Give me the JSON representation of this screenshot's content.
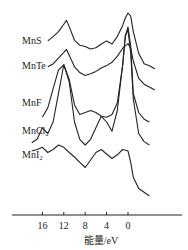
{
  "chart_data": {
    "type": "line",
    "title": "",
    "xlabel": "能量/eV",
    "ylabel": "",
    "x_reversed": true,
    "xlim": [
      20,
      -5
    ],
    "xticks": [
      16,
      12,
      8,
      4,
      0
    ],
    "xtick_labels": [
      "16",
      "12",
      "8",
      "4",
      "0"
    ],
    "grid": false,
    "legend": "none",
    "y_units": "arbitrary (intensity, vertically offset spectra)",
    "series": [
      {
        "name": "MnS",
        "label": "MnS",
        "x": [
          15,
          14,
          13,
          12,
          11.5,
          11,
          10,
          9,
          8,
          7,
          6,
          5,
          4,
          3,
          2,
          1,
          0.5,
          0,
          -0.5,
          -1,
          -2,
          -3,
          -4,
          -5
        ],
        "y": [
          0.55,
          0.62,
          0.7,
          0.82,
          0.88,
          0.78,
          0.56,
          0.48,
          0.46,
          0.42,
          0.44,
          0.5,
          0.55,
          0.5,
          0.62,
          0.8,
          0.92,
          1.0,
          0.95,
          0.7,
          0.35,
          0.18,
          0.15,
          0.1
        ]
      },
      {
        "name": "MnTe",
        "label": "MnTe",
        "x": [
          15,
          14,
          13,
          12,
          11.5,
          11,
          10,
          9,
          8,
          7,
          6,
          5,
          4,
          3,
          2,
          1,
          0,
          -0.5,
          -1,
          -2,
          -3,
          -4,
          -5
        ],
        "y": [
          0.4,
          0.45,
          0.55,
          0.65,
          0.7,
          0.6,
          0.4,
          0.3,
          0.25,
          0.28,
          0.32,
          0.38,
          0.42,
          0.48,
          0.58,
          0.72,
          0.8,
          0.72,
          0.5,
          0.2,
          0.1,
          0.05,
          0.0
        ]
      },
      {
        "name": "MnF",
        "label": "MnF",
        "x": [
          16,
          15,
          14,
          13,
          12,
          11,
          10,
          9,
          8,
          7,
          6,
          5,
          4,
          3,
          2,
          1,
          0.5,
          0,
          -0.5,
          -1,
          -2,
          -3,
          -4
        ],
        "y": [
          0.05,
          0.15,
          0.35,
          0.55,
          0.6,
          0.45,
          0.18,
          0.08,
          0.1,
          0.12,
          0.1,
          0.06,
          0.05,
          0.08,
          0.2,
          0.6,
          0.9,
          1.0,
          0.8,
          0.3,
          0.1,
          0.03,
          0.0
        ]
      },
      {
        "name": "MnCl2",
        "label": "MnCl₂",
        "x": [
          18,
          17,
          16,
          15,
          14,
          13,
          12,
          11,
          10,
          9,
          8,
          7,
          6,
          5,
          4,
          3,
          2,
          1,
          0.5,
          0,
          -0.5,
          -1,
          -2,
          -3,
          -4
        ],
        "y": [
          0.02,
          0.05,
          0.15,
          0.1,
          0.2,
          0.45,
          0.7,
          0.55,
          0.2,
          0.05,
          0.0,
          0.05,
          0.15,
          0.25,
          0.2,
          0.12,
          0.3,
          0.7,
          0.95,
          1.0,
          0.8,
          0.4,
          0.1,
          0.03,
          0.0
        ]
      },
      {
        "name": "MnI2",
        "label": "MnI₂",
        "x": [
          18,
          17,
          16,
          15,
          14,
          13,
          12,
          11,
          10,
          9,
          8,
          7,
          6,
          5,
          4,
          3,
          2,
          1,
          0,
          -0.5,
          -1,
          -2,
          -3,
          -4
        ],
        "y": [
          0.6,
          0.62,
          0.65,
          0.58,
          0.62,
          0.68,
          0.65,
          0.58,
          0.52,
          0.45,
          0.38,
          0.48,
          0.58,
          0.62,
          0.56,
          0.5,
          0.55,
          0.62,
          0.6,
          0.45,
          0.25,
          0.1,
          0.05,
          0.0
        ]
      }
    ]
  }
}
